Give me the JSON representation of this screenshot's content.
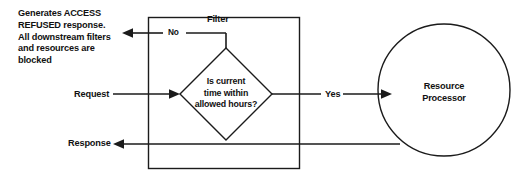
{
  "diagram": {
    "colors": {
      "stroke": "#1b1b1b",
      "text": "#111111",
      "background": "#ffffff"
    },
    "note": {
      "text": "Generates ACCESS\nREFUSED response.\nAll downstream filters\nand resources are\nblocked"
    },
    "container": {
      "label": "Filter"
    },
    "decision": {
      "label": "Is current\ntime within\nallowed hours?"
    },
    "processor": {
      "label": "Resource\nProcessor"
    },
    "edges": {
      "request": "Request",
      "response": "Response",
      "no": "No",
      "yes": "Yes"
    }
  }
}
